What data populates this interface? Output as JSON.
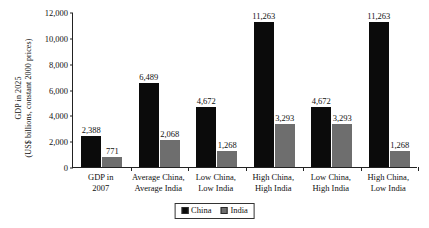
{
  "chart_data": {
    "type": "bar",
    "title": "",
    "xlabel": "",
    "ylabel_line1": "GDP in 2025",
    "ylabel_line2": "(US$ billions, constant 2000 prices)",
    "ylim": [
      0,
      12000
    ],
    "ytick_values": [
      0,
      2000,
      4000,
      6000,
      8000,
      10000,
      12000
    ],
    "ytick_labels": [
      "0",
      "2,000",
      "4,000",
      "6,000",
      "8,000",
      "10,000",
      "12,000"
    ],
    "grid": false,
    "legend_position": "bottom-center",
    "categories": [
      [
        "GDP in",
        "2007"
      ],
      [
        "Average China,",
        "Average India"
      ],
      [
        "Low China,",
        "Low India"
      ],
      [
        "High China,",
        "High India"
      ],
      [
        "Low China,",
        "High India"
      ],
      [
        "High China,",
        "Low India"
      ]
    ],
    "series": [
      {
        "name": "China",
        "color": "#0b0b0b",
        "values": [
          2388,
          6489,
          4672,
          11263,
          4672,
          11263
        ],
        "labels": [
          "2,388",
          "6,489",
          "4,672",
          "11,263",
          "4,672",
          "11,263"
        ]
      },
      {
        "name": "India",
        "color": "#6e6e6e",
        "values": [
          771,
          2068,
          1268,
          3293,
          3293,
          1268
        ],
        "labels": [
          "771",
          "2,068",
          "1,268",
          "3,293",
          "3,293",
          "1,268"
        ]
      }
    ]
  },
  "legend": {
    "items": [
      {
        "label": "China",
        "color": "#0b0b0b"
      },
      {
        "label": "India",
        "color": "#6e6e6e"
      }
    ]
  }
}
